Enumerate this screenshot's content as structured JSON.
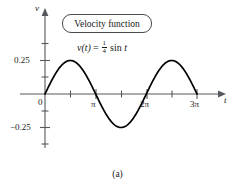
{
  "figure": {
    "caption": "(a)",
    "callout": {
      "label": "Velocity function"
    },
    "equation": {
      "lhs": "v(t)",
      "equals": "=",
      "coefficient_numerator": "1",
      "coefficient_denominator": "4",
      "rhs": "sin t"
    },
    "axes": {
      "x_name": "t",
      "y_name": "v"
    }
  },
  "chart_data": {
    "type": "line",
    "title": "Velocity function",
    "annotation": "v(t) = 1/4 sin t",
    "xlabel": "t",
    "ylabel": "v",
    "grid": false,
    "legend": "none",
    "xlim": [
      -0.35,
      10.6
    ],
    "ylim": [
      -0.42,
      0.46
    ],
    "x_tick_labels": [
      "0",
      "π",
      "2π",
      "3π"
    ],
    "x_tick_values": [
      0,
      3.14159,
      6.28319,
      9.42478
    ],
    "x_minor_tick_values": [
      1.5708,
      4.71239,
      7.85398
    ],
    "y_tick_labels": [
      "0.25",
      "−0.25"
    ],
    "y_tick_values": [
      0.25,
      -0.25
    ],
    "y_minor_tick_values": [
      0.375,
      0.125,
      -0.125,
      -0.375
    ],
    "series": [
      {
        "name": "v(t) = 1/4 sin t",
        "amplitude": 0.25,
        "x": [
          0,
          0.3927,
          0.7854,
          1.1781,
          1.5708,
          1.9635,
          2.3562,
          2.7489,
          3.14159,
          3.5343,
          3.927,
          4.3197,
          4.71239,
          5.1051,
          5.4978,
          5.8905,
          6.28319,
          6.6759,
          7.0686,
          7.4613,
          7.85398,
          8.2467,
          8.6394,
          9.0321,
          9.42478
        ],
        "values": [
          0,
          0.0957,
          0.1768,
          0.231,
          0.25,
          0.231,
          0.1768,
          0.0957,
          0,
          -0.0957,
          -0.1768,
          -0.231,
          -0.25,
          -0.231,
          -0.1768,
          -0.0957,
          0,
          0.0957,
          0.1768,
          0.231,
          0.25,
          0.231,
          0.1768,
          0.0957,
          0
        ]
      }
    ]
  }
}
